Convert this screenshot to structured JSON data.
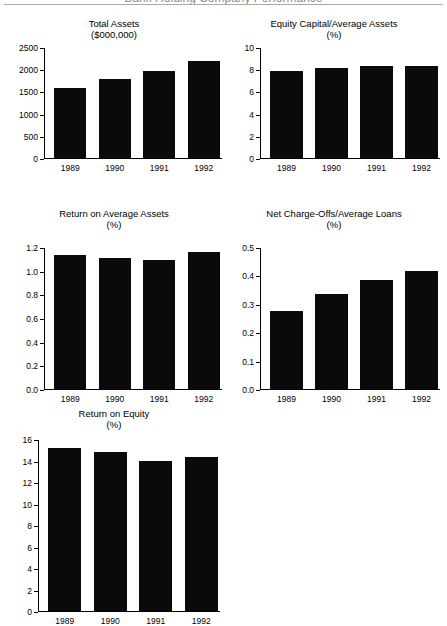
{
  "page": {
    "banner_title": "Bank Holding Company Performance",
    "background": "#ffffff",
    "bar_color": "#0a0a0a",
    "axis_color": "#000000"
  },
  "chart_data": [
    {
      "id": "total-assets",
      "type": "bar",
      "title": "Total Assets",
      "subtitle": "($000,000)",
      "xlabel": "",
      "ylabel": "",
      "categories": [
        "1989",
        "1990",
        "1991",
        "1992"
      ],
      "values": [
        1570,
        1775,
        1970,
        2180
      ],
      "ylim": [
        0,
        2500
      ],
      "ytick_labels": [
        "0",
        "500",
        "1000",
        "1500",
        "2000",
        "2500"
      ],
      "ytick_values": [
        0,
        500,
        1000,
        1500,
        2000,
        2500
      ],
      "grid": false,
      "legend": "none"
    },
    {
      "id": "equity-capital-average-assets",
      "type": "bar",
      "title": "Equity Capital/Average Assets",
      "subtitle": "(%)",
      "xlabel": "",
      "ylabel": "",
      "categories": [
        "1989",
        "1990",
        "1991",
        "1992"
      ],
      "values": [
        7.8,
        8.1,
        8.25,
        8.25
      ],
      "ylim": [
        0,
        10
      ],
      "ytick_labels": [
        "0",
        "2",
        "4",
        "6",
        "8",
        "10"
      ],
      "ytick_values": [
        0,
        2,
        4,
        6,
        8,
        10
      ],
      "grid": false,
      "legend": "none"
    },
    {
      "id": "return-on-average-assets",
      "type": "bar",
      "title": "Return on Average Assets",
      "subtitle": "(%)",
      "xlabel": "",
      "ylabel": "",
      "categories": [
        "1989",
        "1990",
        "1991",
        "1992"
      ],
      "values": [
        1.13,
        1.11,
        1.09,
        1.16
      ],
      "ylim": [
        0,
        1.2
      ],
      "ytick_labels": [
        "0.0",
        "0.2",
        "0.4",
        "0.6",
        "0.8",
        "1.0",
        "1.2"
      ],
      "ytick_values": [
        0,
        0.2,
        0.4,
        0.6,
        0.8,
        1.0,
        1.2
      ],
      "grid": false,
      "legend": "none"
    },
    {
      "id": "net-charge-offs-average-loans",
      "type": "bar",
      "title": "Net Charge-Offs/Average Loans",
      "subtitle": "(%)",
      "xlabel": "",
      "ylabel": "",
      "categories": [
        "1989",
        "1990",
        "1991",
        "1992"
      ],
      "values": [
        0.275,
        0.335,
        0.385,
        0.415
      ],
      "ylim": [
        0,
        0.5
      ],
      "ytick_labels": [
        "0.0",
        "0.1",
        "0.2",
        "0.3",
        "0.4",
        "0.5"
      ],
      "ytick_values": [
        0,
        0.1,
        0.2,
        0.3,
        0.4,
        0.5
      ],
      "grid": false,
      "legend": "none"
    },
    {
      "id": "return-on-equity",
      "type": "bar",
      "title": "Return on Equity",
      "subtitle": "(%)",
      "xlabel": "",
      "ylabel": "",
      "categories": [
        "1989",
        "1990",
        "1991",
        "1992"
      ],
      "values": [
        15.15,
        14.8,
        14.0,
        14.3
      ],
      "ylim": [
        0,
        16
      ],
      "ytick_labels": [
        "0",
        "2",
        "4",
        "6",
        "8",
        "10",
        "12",
        "14",
        "16"
      ],
      "ytick_values": [
        0,
        2,
        4,
        6,
        8,
        10,
        12,
        14,
        16
      ],
      "grid": false,
      "legend": "none",
      "clipped_bottom": true
    }
  ]
}
